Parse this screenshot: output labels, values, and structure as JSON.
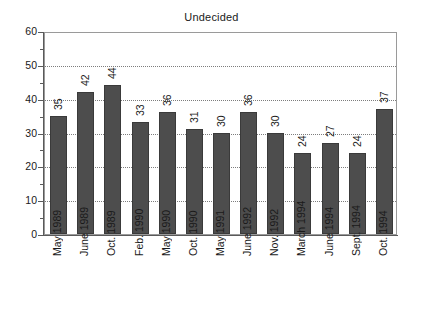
{
  "chart_data": {
    "type": "bar",
    "title": "Undecided",
    "xlabel": "",
    "ylabel": "",
    "ylim": [
      0,
      60
    ],
    "ytick_step": 10,
    "yminor_step": 5,
    "grid": "horizontal-dotted",
    "legend": "none",
    "bar_color": "#4d4d4d",
    "categories": [
      "May 1989",
      "June 1989",
      "Oct. 1989",
      "Feb. 1990",
      "May 1990",
      "Oct. 1990",
      "May 1991",
      "June 1992",
      "Nov. 1992",
      "March 1994",
      "June 1994",
      "Sept. 1994",
      "Oct. 1994"
    ],
    "values": [
      35,
      42,
      44,
      33,
      36,
      31,
      30,
      36,
      30,
      24,
      27,
      24,
      37
    ],
    "ytick_labels": [
      "0",
      "10",
      "20",
      "30",
      "40",
      "50",
      "60"
    ],
    "ytick_values": [
      0,
      10,
      20,
      30,
      40,
      50,
      60
    ]
  }
}
